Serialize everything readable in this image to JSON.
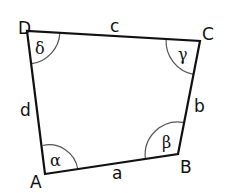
{
  "diagram": {
    "type": "quadrilateral",
    "vertices": [
      {
        "id": "A",
        "label": "A",
        "x": 45,
        "y": 174
      },
      {
        "id": "B",
        "label": "B",
        "x": 178,
        "y": 154
      },
      {
        "id": "C",
        "label": "C",
        "x": 200,
        "y": 41
      },
      {
        "id": "D",
        "label": "D",
        "x": 27,
        "y": 31
      }
    ],
    "sides": [
      {
        "id": "a",
        "label": "a",
        "from": "A",
        "to": "B"
      },
      {
        "id": "b",
        "label": "b",
        "from": "B",
        "to": "C"
      },
      {
        "id": "c",
        "label": "c",
        "from": "C",
        "to": "D"
      },
      {
        "id": "d",
        "label": "d",
        "from": "D",
        "to": "A"
      }
    ],
    "angles": [
      {
        "vertex": "A",
        "label": "α"
      },
      {
        "vertex": "B",
        "label": "β"
      },
      {
        "vertex": "C",
        "label": "γ"
      },
      {
        "vertex": "D",
        "label": "δ"
      }
    ],
    "colors": {
      "outline": "#111111",
      "arc": "#555555",
      "background": "#ffffff"
    }
  }
}
